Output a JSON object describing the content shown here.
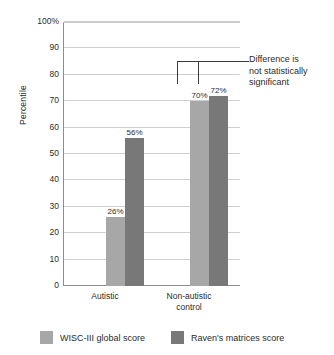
{
  "chart_data": {
    "type": "bar",
    "title": "",
    "xlabel": "",
    "ylabel": "Percentile",
    "ylim": [
      0,
      100
    ],
    "grid": true,
    "legend_position": "bottom",
    "categories": [
      "Autistic",
      "Non-autistic control"
    ],
    "category_labels": [
      {
        "line1": "Autistic",
        "line2": ""
      },
      {
        "line1": "Non-autistic",
        "line2": "control"
      }
    ],
    "series": [
      {
        "name": "WISC-III global score",
        "color": "#a7a7a7",
        "values": [
          26,
          70
        ],
        "value_labels": [
          "26%",
          "70%"
        ]
      },
      {
        "name": "Raven's matrices score",
        "color": "#787878",
        "values": [
          56,
          72
        ],
        "value_labels": [
          "56%",
          "72%"
        ]
      }
    ],
    "y_ticks": [
      {
        "value": 100,
        "label": "100%"
      },
      {
        "value": 90,
        "label": "90"
      },
      {
        "value": 80,
        "label": "80"
      },
      {
        "value": 70,
        "label": "70"
      },
      {
        "value": 60,
        "label": "60"
      },
      {
        "value": 50,
        "label": "50"
      },
      {
        "value": 40,
        "label": "40"
      },
      {
        "value": 30,
        "label": "30"
      },
      {
        "value": 20,
        "label": "20"
      },
      {
        "value": 10,
        "label": "10"
      },
      {
        "value": 0,
        "label": "0"
      }
    ],
    "annotations": [
      {
        "text_line1": "Difference is",
        "text_line2": "not statistically",
        "text_line3": "significant",
        "connects": [
          "Non-autistic control / WISC-III global score",
          "Non-autistic control / Raven's matrices score"
        ]
      }
    ]
  },
  "legend": {
    "items": [
      {
        "label": "WISC-III global score",
        "color": "#a7a7a7"
      },
      {
        "label": "Raven's matrices score",
        "color": "#787878"
      }
    ]
  }
}
